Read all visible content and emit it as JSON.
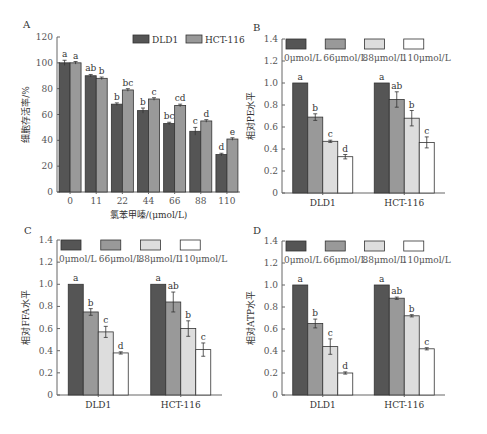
{
  "colors": {
    "c0": "#555555",
    "c66": "#999999",
    "c88": "#dddddd",
    "c110": "#ffffff",
    "dld1": "#555555",
    "hct": "#999999",
    "border": "#333333"
  },
  "chart_data": [
    {
      "panel": "A",
      "type": "bar",
      "title": "",
      "xlabel": "氯苯甲嗪/(μmol/L)",
      "ylabel": "细胞存活率/%",
      "ylim": [
        0,
        120
      ],
      "yticks": [
        0,
        20,
        40,
        60,
        80,
        100,
        120
      ],
      "categories": [
        "0",
        "11",
        "22",
        "44",
        "66",
        "88",
        "110"
      ],
      "legend_position": "top-right",
      "series": [
        {
          "name": "DLD1",
          "values": [
            100,
            90,
            68,
            63,
            53,
            47,
            29
          ],
          "errors": [
            2,
            1,
            1,
            2,
            1,
            3,
            1
          ],
          "letters": [
            "a",
            "ab",
            "b",
            "b",
            "bc",
            "c",
            "d"
          ]
        },
        {
          "name": "HCT-116",
          "values": [
            100,
            88,
            79,
            72,
            67,
            55,
            41
          ],
          "errors": [
            1,
            1,
            1,
            1,
            1,
            1,
            1
          ],
          "letters": [
            "a",
            "b",
            "bc",
            "c",
            "cd",
            "d",
            "e"
          ]
        }
      ]
    },
    {
      "panel": "B",
      "type": "bar",
      "xlabel": "",
      "ylabel": "相对PE水平",
      "ylim": [
        0,
        1.4
      ],
      "yticks": [
        "0",
        "0.2",
        "0.4",
        "0.6",
        "0.8",
        "1.0",
        "1.2",
        "1.4"
      ],
      "categories": [
        "DLD1",
        "HCT-116"
      ],
      "legend_position": "top",
      "series": [
        {
          "name": "0μmol/L",
          "values": [
            1.0,
            1.0
          ],
          "errors": [
            0,
            0
          ],
          "letters": [
            "a",
            "a"
          ]
        },
        {
          "name": "66μmol/L",
          "values": [
            0.69,
            0.85
          ],
          "errors": [
            0.03,
            0.07
          ],
          "letters": [
            "b",
            "ab"
          ]
        },
        {
          "name": "88μmol/L",
          "values": [
            0.47,
            0.68
          ],
          "errors": [
            0.01,
            0.07
          ],
          "letters": [
            "c",
            "b"
          ]
        },
        {
          "name": "110μmol/L",
          "values": [
            0.33,
            0.46
          ],
          "errors": [
            0.02,
            0.05
          ],
          "letters": [
            "d",
            "c"
          ]
        }
      ]
    },
    {
      "panel": "C",
      "type": "bar",
      "xlabel": "",
      "ylabel": "相对FFA水平",
      "ylim": [
        0,
        1.4
      ],
      "yticks": [
        "0",
        "0.2",
        "0.4",
        "0.6",
        "0.8",
        "1.0",
        "1.2",
        "1.4"
      ],
      "categories": [
        "DLD1",
        "HCT-116"
      ],
      "legend_position": "top",
      "series": [
        {
          "name": "0μmol/L",
          "values": [
            1.0,
            1.0
          ],
          "errors": [
            0,
            0
          ],
          "letters": [
            "a",
            "a"
          ]
        },
        {
          "name": "66μmol/L",
          "values": [
            0.75,
            0.84
          ],
          "errors": [
            0.03,
            0.09
          ],
          "letters": [
            "b",
            "ab"
          ]
        },
        {
          "name": "88μmol/L",
          "values": [
            0.57,
            0.6
          ],
          "errors": [
            0.05,
            0.07
          ],
          "letters": [
            "c",
            "b"
          ]
        },
        {
          "name": "110μmol/L",
          "values": [
            0.38,
            0.41
          ],
          "errors": [
            0.01,
            0.06
          ],
          "letters": [
            "d",
            "c"
          ]
        }
      ]
    },
    {
      "panel": "D",
      "type": "bar",
      "xlabel": "",
      "ylabel": "相对ATP水平",
      "ylim": [
        0,
        1.4
      ],
      "yticks": [
        "0",
        "0.2",
        "0.4",
        "0.6",
        "0.8",
        "1.0",
        "1.2",
        "1.4"
      ],
      "categories": [
        "DLD1",
        "HCT-116"
      ],
      "legend_position": "top",
      "series": [
        {
          "name": "0μmol/L",
          "values": [
            1.0,
            1.0
          ],
          "errors": [
            0,
            0
          ],
          "letters": [
            "a",
            "a"
          ]
        },
        {
          "name": "66μmol/L",
          "values": [
            0.65,
            0.88
          ],
          "errors": [
            0.04,
            0.01
          ],
          "letters": [
            "b",
            "ab"
          ]
        },
        {
          "name": "88μmol/L",
          "values": [
            0.44,
            0.72
          ],
          "errors": [
            0.07,
            0.01
          ],
          "letters": [
            "c",
            "b"
          ]
        },
        {
          "name": "110μmol/L",
          "values": [
            0.2,
            0.42
          ],
          "errors": [
            0.01,
            0.01
          ],
          "letters": [
            "d",
            "c"
          ]
        }
      ]
    }
  ]
}
